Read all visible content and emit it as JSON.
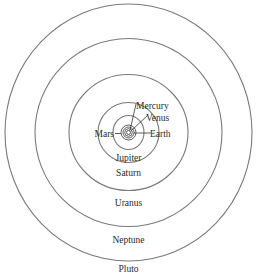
{
  "diagram": {
    "type": "solar-system-orbits",
    "center": {
      "x": 128.5,
      "y": 132.5
    },
    "orbits": [
      {
        "planet": "Pluto",
        "rx": 123.5,
        "ry": 128.5,
        "label": "Pluto",
        "label_pos": {
          "x": 128.5,
          "y": 272
        }
      },
      {
        "planet": "Neptune",
        "rx": 93.5,
        "ry": 94,
        "label": "Neptune",
        "label_pos": {
          "x": 128.5,
          "y": 243
        }
      },
      {
        "planet": "Uranus",
        "rx": 59.5,
        "ry": 58,
        "label": "Uranus",
        "label_pos": {
          "x": 128.5,
          "y": 206
        }
      },
      {
        "planet": "Saturn",
        "rx": 30.5,
        "ry": 30,
        "label": "Saturn",
        "label_pos": {
          "x": 128.5,
          "y": 176
        }
      },
      {
        "planet": "Jupiter",
        "rx": 15.5,
        "ry": 17,
        "label": "Jupiter",
        "label_pos": {
          "x": 128.5,
          "y": 161
        }
      }
    ],
    "inner_orbits": [
      {
        "planet": "Mars",
        "r": 7.5
      },
      {
        "planet": "Earth",
        "r": 5.5
      },
      {
        "planet": "Venus",
        "r": 3.8
      },
      {
        "planet": "Mercury",
        "r": 2
      }
    ],
    "inner_labels": [
      {
        "label": "Mercury",
        "text_x": 136,
        "text_y": 109,
        "anchor": "start",
        "line": {
          "x1": 130,
          "y1": 130.5,
          "x2": 136,
          "y2": 104
        }
      },
      {
        "label": "Venus",
        "text_x": 146,
        "text_y": 121,
        "anchor": "start",
        "line": {
          "x1": 131.5,
          "y1": 130.5,
          "x2": 148,
          "y2": 115
        }
      },
      {
        "label": "Earth",
        "text_x": 150,
        "text_y": 137,
        "anchor": "start",
        "line": {
          "x1": 134,
          "y1": 133,
          "x2": 151,
          "y2": 133
        }
      },
      {
        "label": "Mars",
        "text_x": 114,
        "text_y": 137,
        "anchor": "end",
        "line": {
          "x1": 115,
          "y1": 133.5,
          "x2": 121,
          "y2": 133.5
        }
      }
    ],
    "colors": {
      "outer_orbit": "#7a7a7a",
      "inner_orbit": "#333333",
      "text": "#2a2a2a",
      "background": "#ffffff"
    }
  }
}
